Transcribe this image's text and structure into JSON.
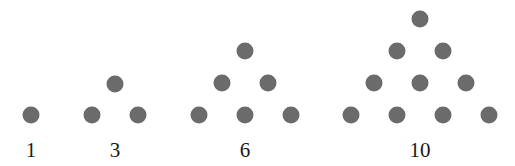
{
  "dot_color": "#6b6b6b",
  "figures": [
    {
      "label": "1",
      "label_pos": [
        31,
        150
      ],
      "dots": [
        [
          31,
          115
        ]
      ]
    },
    {
      "label": "3",
      "label_pos": [
        115,
        150
      ],
      "dots": [
        [
          115,
          84
        ],
        [
          92,
          115
        ],
        [
          138,
          115
        ]
      ]
    },
    {
      "label": "6",
      "label_pos": [
        245,
        150
      ],
      "dots": [
        [
          245,
          51
        ],
        [
          222,
          83
        ],
        [
          268,
          83
        ],
        [
          199,
          115
        ],
        [
          245,
          115
        ],
        [
          291,
          115
        ]
      ]
    },
    {
      "label": "10",
      "label_pos": [
        420,
        150
      ],
      "dots": [
        [
          420,
          19
        ],
        [
          397,
          51
        ],
        [
          443,
          51
        ],
        [
          374,
          83
        ],
        [
          420,
          83
        ],
        [
          466,
          83
        ],
        [
          351,
          115
        ],
        [
          397,
          115
        ],
        [
          443,
          115
        ],
        [
          489,
          115
        ]
      ]
    }
  ]
}
